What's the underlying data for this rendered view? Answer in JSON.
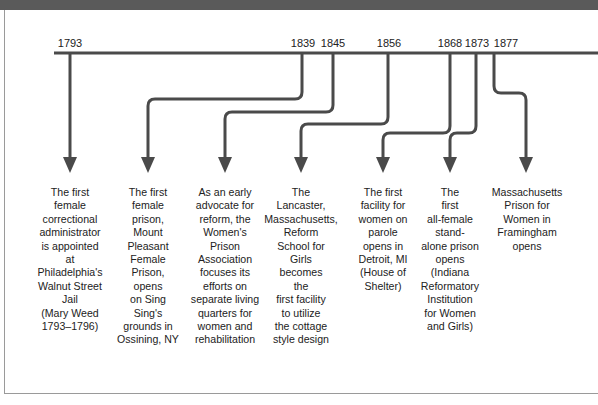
{
  "figure": {
    "line_color": "#4a4a4a",
    "header_color": "#5a5a5a"
  },
  "events": [
    {
      "year": "1793",
      "lines": [
        "The first",
        "female",
        "correctional",
        "administrator",
        "is appointed",
        "at",
        "Philadelphia's",
        "Walnut Street",
        "Jail",
        "(Mary Weed",
        "1793–1796)"
      ]
    },
    {
      "year": "1839",
      "lines": [
        "The first",
        "female",
        "prison,",
        "Mount",
        "Pleasant",
        "Female",
        "Prison,",
        "opens",
        "on Sing",
        "Sing's",
        "grounds in",
        "Ossining, NY"
      ]
    },
    {
      "year": "1845",
      "lines": [
        "As an early",
        "advocate for",
        "reform, the",
        "Women's",
        "Prison",
        "Association",
        "focuses its",
        "efforts on",
        "separate living",
        "quarters for",
        "women and",
        "rehabilitation"
      ]
    },
    {
      "year": "1856",
      "lines": [
        "The",
        "Lancaster,",
        "Massachusetts,",
        "Reform",
        "School for",
        "Girls",
        "becomes",
        "the",
        "first facility",
        "to utilize",
        "the cottage",
        "style design"
      ]
    },
    {
      "year": "1868",
      "lines": [
        "The first",
        "facility for",
        "women on",
        "parole",
        "opens in",
        "Detroit, MI",
        "(House of",
        "Shelter)"
      ]
    },
    {
      "year": "1873",
      "lines": [
        "The",
        "first",
        "all-female",
        "stand-",
        "alone prison",
        "opens",
        "(Indiana",
        "Reformatory",
        "Institution",
        "for Women",
        "and Girls)"
      ]
    },
    {
      "year": "1877",
      "lines": [
        "Massachusetts",
        "Prison for",
        "Women in",
        "Framingham",
        "opens"
      ]
    }
  ]
}
